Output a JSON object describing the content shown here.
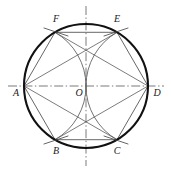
{
  "figure": {
    "type": "geometric-diagram",
    "canvas": {
      "width": 171,
      "height": 171,
      "background": "#ffffff"
    },
    "circle": {
      "center_label": "O",
      "cx": 86,
      "cy": 86,
      "r": 62,
      "stroke": "#111111",
      "stroke_width": 2.1
    },
    "colors": {
      "heavy_ink": "#111111",
      "light_ink": "#5a5a5a",
      "axis_ink": "#6b6b6b",
      "label_ink": "#1a1a1a"
    },
    "points": [
      {
        "id": "A",
        "label": "A",
        "x": 24,
        "y": 86,
        "label_x": 16,
        "label_y": 94,
        "role": "hexagon-vertex-left"
      },
      {
        "id": "F",
        "label": "F",
        "x": 55,
        "y": 32.31,
        "label_x": 56,
        "label_y": 20,
        "role": "hexagon-vertex-upper-left"
      },
      {
        "id": "E",
        "label": "E",
        "x": 117,
        "y": 32.31,
        "label_x": 117,
        "label_y": 20,
        "role": "hexagon-vertex-upper-right"
      },
      {
        "id": "D",
        "label": "D",
        "x": 148,
        "y": 86,
        "label_x": 157,
        "label_y": 94,
        "role": "hexagon-vertex-right"
      },
      {
        "id": "C",
        "label": "C",
        "x": 117,
        "y": 139.69,
        "label_x": 117,
        "label_y": 152,
        "role": "hexagon-vertex-lower-right"
      },
      {
        "id": "B",
        "label": "B",
        "x": 55,
        "y": 139.69,
        "label_x": 56,
        "label_y": 152,
        "role": "hexagon-vertex-lower-left"
      },
      {
        "id": "O",
        "label": "O",
        "x": 86,
        "y": 86,
        "label_x": 79,
        "label_y": 94,
        "role": "circle-center"
      }
    ],
    "hexagon_sides": [
      {
        "from": "A",
        "to": "F"
      },
      {
        "from": "F",
        "to": "E"
      },
      {
        "from": "E",
        "to": "D"
      },
      {
        "from": "D",
        "to": "C"
      },
      {
        "from": "C",
        "to": "B"
      },
      {
        "from": "B",
        "to": "A"
      }
    ],
    "diagonals": [
      {
        "from": "A",
        "to": "E"
      },
      {
        "from": "A",
        "to": "C"
      },
      {
        "from": "D",
        "to": "F"
      },
      {
        "from": "D",
        "to": "B"
      }
    ],
    "construction_arcs": [
      {
        "id": "arc-from-A",
        "center": "A",
        "radius": 62,
        "from_point": "F",
        "to_point": "B",
        "through": "O",
        "note": "compass arc radius = circle radius, swung from A"
      },
      {
        "id": "arc-from-D",
        "center": "D",
        "radius": 62,
        "from_point": "E",
        "to_point": "C",
        "through": "O",
        "note": "compass arc radius = circle radius, swung from D"
      }
    ],
    "arc_ticks": [
      {
        "id": "tick-at-F",
        "at": "F"
      },
      {
        "id": "tick-at-E",
        "at": "E"
      },
      {
        "id": "tick-at-B",
        "at": "B"
      },
      {
        "id": "tick-at-C",
        "at": "C"
      }
    ],
    "axes": [
      {
        "id": "horizontal-centerline",
        "orientation": "horizontal",
        "x1": 8,
        "y1": 86,
        "x2": 164,
        "y2": 86,
        "style": "dash-dot"
      },
      {
        "id": "vertical-centerline",
        "orientation": "vertical",
        "x1": 86,
        "y1": 6,
        "x2": 86,
        "y2": 166,
        "style": "dash-dot"
      }
    ],
    "labels_note": "Vertices labelled counter-clockwise from A: A, F, E, D, C, B; centre O."
  }
}
